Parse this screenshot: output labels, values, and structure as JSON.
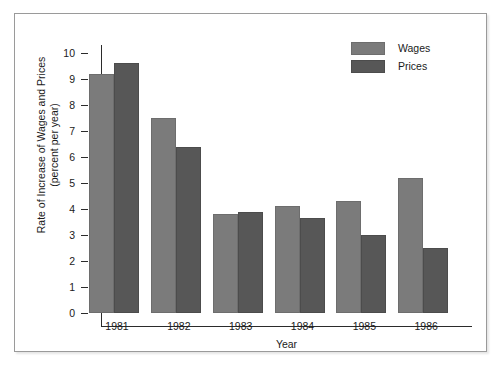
{
  "chart_data": {
    "type": "bar",
    "title": "",
    "xlabel": "Year",
    "ylabel_line1": "Rate of Increase of Wages and Prices",
    "ylabel_line2": "(percent per year)",
    "categories": [
      "1981",
      "1982",
      "1983",
      "1984",
      "1985",
      "1986"
    ],
    "series": [
      {
        "name": "Wages",
        "color": "#7b7b7b",
        "values": [
          9.2,
          7.5,
          3.8,
          4.1,
          4.3,
          5.2
        ]
      },
      {
        "name": "Prices",
        "color": "#575757",
        "values": [
          9.6,
          6.4,
          3.9,
          3.65,
          3.0,
          2.5
        ]
      }
    ],
    "ylim": [
      0,
      10.6
    ],
    "yticks": [
      0,
      1,
      2,
      3,
      4,
      5,
      6,
      7,
      8,
      9,
      10
    ],
    "ytick_labels": [
      "0",
      "1",
      "2",
      "3",
      "4",
      "5",
      "6",
      "7",
      "8",
      "9",
      "10"
    ],
    "grid": false,
    "legend_position": "top-right",
    "legend_entries": [
      "Wages",
      "Prices"
    ]
  }
}
